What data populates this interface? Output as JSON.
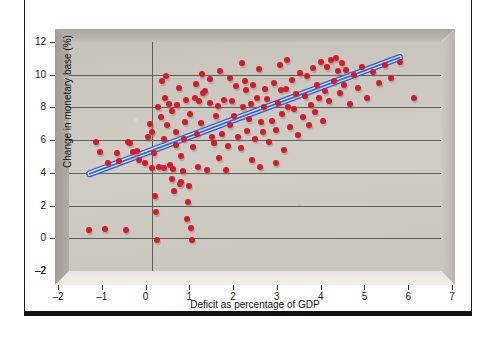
{
  "figure": {
    "top_caption": "",
    "frame_color": "#111111",
    "background": "#ffffff"
  },
  "chart_data": {
    "type": "scatter",
    "title": "",
    "xlabel": "Deficit as percentage of GDP",
    "ylabel": "Change in monetary base (%)",
    "xlim": [
      -2,
      7
    ],
    "ylim": [
      -2,
      12
    ],
    "xticks": [
      -2,
      -1,
      0,
      1,
      2,
      3,
      4,
      5,
      6,
      7
    ],
    "xticklabels": [
      "–2",
      "–1",
      "0",
      "1",
      "2",
      "3",
      "4",
      "5",
      "6",
      "7"
    ],
    "yticks": [
      -2,
      0,
      2,
      4,
      6,
      8,
      10,
      12
    ],
    "yticklabels": [
      "–2",
      "0",
      "2",
      "4",
      "6",
      "8",
      "10",
      "12"
    ],
    "grid": {
      "horizontal": true,
      "vertical_at": [
        0
      ]
    },
    "marker_color": "#d7192b",
    "marker_size_px": 6,
    "plot_background": "#c9c7be",
    "legend": null,
    "series": [
      {
        "name": "Countries",
        "points": [
          [
            -1.52,
            0.5
          ],
          [
            -1.12,
            0.55
          ],
          [
            -0.62,
            0.5
          ],
          [
            -1.35,
            5.9
          ],
          [
            -1.25,
            5.3
          ],
          [
            -1.05,
            4.6
          ],
          [
            -0.85,
            5.2
          ],
          [
            -0.78,
            4.7
          ],
          [
            -0.58,
            5.9
          ],
          [
            -0.52,
            5.85
          ],
          [
            -0.45,
            5.3
          ],
          [
            -0.35,
            5.35
          ],
          [
            -0.3,
            4.8
          ],
          [
            -0.15,
            4.6
          ],
          [
            -0.1,
            6.2
          ],
          [
            -0.05,
            7.0
          ],
          [
            0.0,
            4.3
          ],
          [
            0.02,
            6.5
          ],
          [
            0.05,
            5.2
          ],
          [
            0.08,
            2.6
          ],
          [
            0.1,
            1.6
          ],
          [
            0.12,
            -0.1
          ],
          [
            0.18,
            4.35
          ],
          [
            0.22,
            7.4
          ],
          [
            0.25,
            9.6
          ],
          [
            0.3,
            4.3
          ],
          [
            0.33,
            8.6
          ],
          [
            0.38,
            6.9
          ],
          [
            0.42,
            8.2
          ],
          [
            0.45,
            4.5
          ],
          [
            0.48,
            3.6
          ],
          [
            0.52,
            4.25
          ],
          [
            0.55,
            2.9
          ],
          [
            0.58,
            5.7
          ],
          [
            0.6,
            6.5
          ],
          [
            0.62,
            8.15
          ],
          [
            0.65,
            9.2
          ],
          [
            0.68,
            3.3
          ],
          [
            0.72,
            3.45
          ],
          [
            0.75,
            4.1
          ],
          [
            0.78,
            6.1
          ],
          [
            0.8,
            7.1
          ],
          [
            0.82,
            8.45
          ],
          [
            0.85,
            1.2
          ],
          [
            0.88,
            2.2
          ],
          [
            0.9,
            3.2
          ],
          [
            0.95,
            0.6
          ],
          [
            0.98,
            -0.1
          ],
          [
            1.0,
            5.6
          ],
          [
            1.05,
            8.6
          ],
          [
            1.1,
            6.4
          ],
          [
            1.15,
            8.4
          ],
          [
            1.2,
            7.05
          ],
          [
            1.25,
            8.9
          ],
          [
            1.3,
            9.0
          ],
          [
            1.35,
            4.2
          ],
          [
            1.4,
            8.3
          ],
          [
            1.45,
            6.2
          ],
          [
            1.5,
            5.8
          ],
          [
            1.55,
            7.45
          ],
          [
            1.6,
            8.1
          ],
          [
            1.65,
            10.2
          ],
          [
            1.7,
            6.4
          ],
          [
            1.75,
            8.45
          ],
          [
            1.8,
            4.2
          ],
          [
            1.85,
            5.65
          ],
          [
            1.9,
            6.9
          ],
          [
            1.95,
            8.4
          ],
          [
            2.0,
            7.5
          ],
          [
            2.05,
            9.3
          ],
          [
            2.1,
            6.2
          ],
          [
            2.15,
            5.5
          ],
          [
            2.2,
            8.0
          ],
          [
            2.25,
            9.6
          ],
          [
            2.3,
            6.55
          ],
          [
            2.35,
            7.3
          ],
          [
            2.4,
            8.2
          ],
          [
            2.45,
            9.4
          ],
          [
            2.5,
            6.1
          ],
          [
            2.55,
            8.6
          ],
          [
            2.6,
            10.35
          ],
          [
            2.65,
            7.1
          ],
          [
            2.7,
            6.5
          ],
          [
            2.75,
            9.15
          ],
          [
            2.8,
            8.5
          ],
          [
            2.85,
            5.9
          ],
          [
            2.9,
            7.2
          ],
          [
            2.95,
            9.5
          ],
          [
            3.0,
            6.6
          ],
          [
            3.05,
            8.3
          ],
          [
            3.1,
            10.6
          ],
          [
            3.15,
            7.6
          ],
          [
            3.2,
            5.4
          ],
          [
            3.25,
            9.1
          ],
          [
            3.3,
            8.0
          ],
          [
            3.35,
            6.8
          ],
          [
            3.4,
            9.7
          ],
          [
            3.45,
            7.9
          ],
          [
            3.5,
            8.8
          ],
          [
            3.55,
            6.3
          ],
          [
            3.6,
            10.1
          ],
          [
            3.65,
            7.4
          ],
          [
            3.7,
            8.7
          ],
          [
            3.75,
            9.9
          ],
          [
            3.8,
            6.9
          ],
          [
            3.85,
            8.15
          ],
          [
            3.9,
            10.4
          ],
          [
            3.95,
            7.7
          ],
          [
            4.0,
            9.35
          ],
          [
            4.05,
            8.6
          ],
          [
            4.1,
            10.8
          ],
          [
            4.15,
            7.2
          ],
          [
            4.2,
            9.0
          ],
          [
            4.25,
            10.5
          ],
          [
            4.3,
            8.4
          ],
          [
            4.35,
            10.9
          ],
          [
            4.4,
            9.6
          ],
          [
            4.45,
            11.0
          ],
          [
            4.5,
            10.2
          ],
          [
            4.55,
            8.9
          ],
          [
            4.6,
            10.7
          ],
          [
            4.65,
            9.4
          ],
          [
            4.7,
            10.3
          ],
          [
            4.8,
            8.2
          ],
          [
            4.9,
            10.0
          ],
          [
            5.0,
            9.2
          ],
          [
            5.1,
            10.5
          ],
          [
            5.2,
            8.6
          ],
          [
            5.35,
            10.15
          ],
          [
            5.5,
            9.5
          ],
          [
            5.65,
            10.6
          ],
          [
            5.8,
            9.8
          ],
          [
            6.0,
            10.75
          ],
          [
            6.35,
            8.6
          ],
          [
            0.3,
            6.05
          ],
          [
            0.5,
            7.8
          ],
          [
            0.7,
            5.05
          ],
          [
            1.12,
            4.35
          ],
          [
            1.22,
            10.05
          ],
          [
            1.42,
            9.75
          ],
          [
            1.62,
            4.9
          ],
          [
            2.18,
            10.7
          ],
          [
            2.42,
            4.8
          ],
          [
            2.62,
            4.35
          ],
          [
            3.02,
            4.6
          ],
          [
            3.28,
            10.9
          ],
          [
            0.15,
            8.05
          ],
          [
            0.35,
            9.95
          ],
          [
            2.28,
            9.05
          ],
          [
            1.9,
            9.8
          ],
          [
            2.72,
            8.05
          ],
          [
            3.12,
            9.05
          ],
          [
            0.92,
            7.6
          ],
          [
            1.08,
            9.45
          ]
        ]
      }
    ],
    "trendline": {
      "type": "linear",
      "color": "#2e5bd8",
      "fill": "#cfe0fb",
      "x_start": -1.5,
      "y_start": 3.95,
      "x_end": 6.0,
      "y_end": 11.05
    }
  }
}
